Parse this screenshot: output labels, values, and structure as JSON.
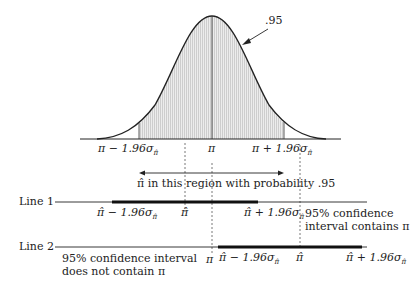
{
  "curve": {
    "area_label": ".95",
    "lower_bound_label": "π − 1.96σ",
    "center_label": "π",
    "upper_bound_label": "π + 1.96σ",
    "sigma_subscript": "π̂"
  },
  "region_arrow": {
    "label": "π̂ in this region with probability .95"
  },
  "line1": {
    "label": "Line 1",
    "lower_label": "π̂ − 1.96σ",
    "center_label": "π̂",
    "upper_label": "π̂ + 1.96σ",
    "note_line1": "95% confidence",
    "note_line2": "interval contains π"
  },
  "line2": {
    "label": "Line 2",
    "pi_label": "π",
    "lower_label": "π̂ − 1.96σ",
    "center_label": "π̂",
    "upper_label": "π̂ + 1.96σ",
    "note_line1": "95% confidence interval",
    "note_line2": "does not contain π"
  },
  "colors": {
    "line": "#222222",
    "shade": "#d8d8d8",
    "dash": "#555555"
  }
}
